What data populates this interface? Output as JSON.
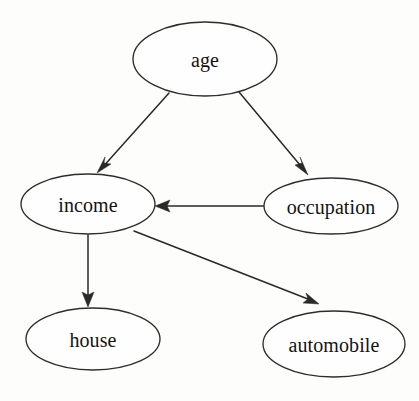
{
  "diagram": {
    "type": "directed-graph",
    "background_color": "#fdfdfc",
    "node_fill_color": "#fefefe",
    "node_stroke_color": "#2f2d2b",
    "edge_color": "#2b2927",
    "label_color": "#151311",
    "nodes": [
      {
        "id": "age",
        "label": "age",
        "cx": 205,
        "cy": 59,
        "rx": 72,
        "ry": 37
      },
      {
        "id": "income",
        "label": "income",
        "cx": 88,
        "cy": 204,
        "rx": 67,
        "ry": 30
      },
      {
        "id": "occupation",
        "label": "occupation",
        "cx": 331,
        "cy": 206,
        "rx": 67,
        "ry": 28
      },
      {
        "id": "house",
        "label": "house",
        "cx": 93,
        "cy": 339,
        "rx": 67,
        "ry": 31
      },
      {
        "id": "automobile",
        "label": "automobile",
        "cx": 334,
        "cy": 344,
        "rx": 71,
        "ry": 33
      }
    ],
    "edges": [
      {
        "id": "age-to-income",
        "from": "age",
        "to": "income",
        "x1": 169,
        "y1": 93,
        "x2": 98,
        "y2": 172,
        "arrowhead": "filled-triangle"
      },
      {
        "id": "age-to-occupation",
        "from": "age",
        "to": "occupation",
        "x1": 239,
        "y1": 92,
        "x2": 308,
        "y2": 174,
        "arrowhead": "filled-triangle"
      },
      {
        "id": "occupation-to-income",
        "from": "occupation",
        "to": "income",
        "x1": 264,
        "y1": 206,
        "x2": 156,
        "y2": 206,
        "arrowhead": "filled-triangle"
      },
      {
        "id": "income-to-house",
        "from": "income",
        "to": "house",
        "x1": 88,
        "y1": 235,
        "x2": 88,
        "y2": 306,
        "arrowhead": "filled-triangle"
      },
      {
        "id": "income-to-automobile",
        "from": "income",
        "to": "automobile",
        "x1": 134,
        "y1": 231,
        "x2": 318,
        "y2": 303,
        "arrowhead": "filled-triangle"
      }
    ]
  }
}
